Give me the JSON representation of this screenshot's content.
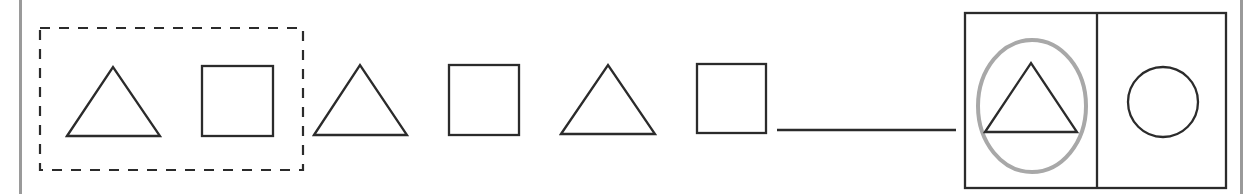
{
  "diagram": {
    "title": "",
    "colors": {
      "stroke": "#2b2b2b",
      "dashed_group": "#2b2b2b",
      "highlight_ellipse": "#a8a8a8",
      "side_bars": "#9a9a9a",
      "background": "#ffffff"
    },
    "pattern_group": {
      "label": "repeating unit",
      "shapes": [
        "triangle",
        "square"
      ]
    },
    "sequence": [
      "triangle",
      "square",
      "triangle",
      "square",
      "triangle",
      "square"
    ],
    "blank": "answer-line",
    "answer_choices": [
      {
        "shape": "triangle",
        "selected": true
      },
      {
        "shape": "circle",
        "selected": false
      }
    ]
  }
}
